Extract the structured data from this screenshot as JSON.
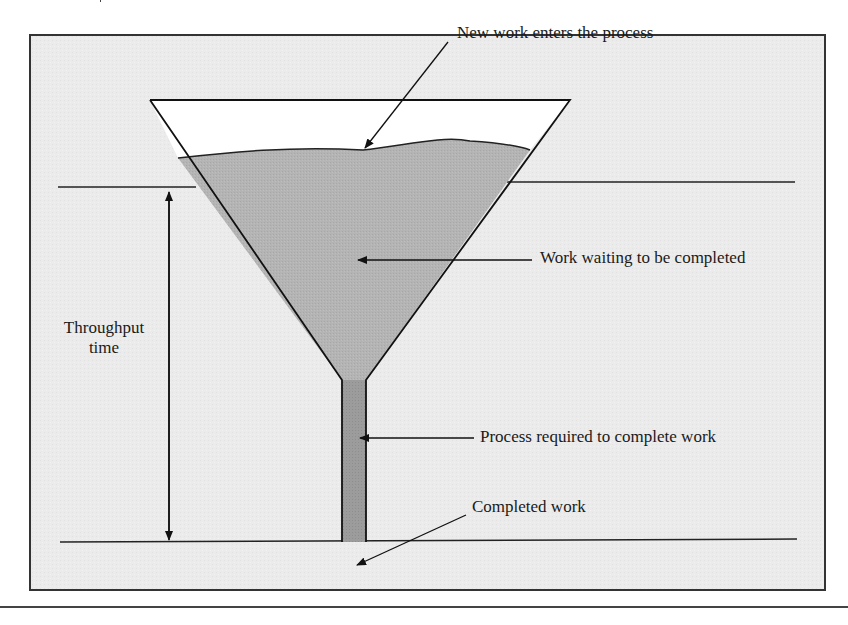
{
  "diagram": {
    "type": "funnel-process-diagram",
    "colors": {
      "frame_background": "#ececec",
      "frame_border": "#333333",
      "funnel_empty": "#ffffff",
      "work_waiting_fill": "#b3b3b3",
      "process_tube_fill": "#9a9a9a",
      "line_color": "#222222"
    },
    "labels": {
      "new_work": "New work enters the process",
      "work_waiting": "Work waiting to be completed",
      "throughput_line1": "Throughput",
      "throughput_line2": "time",
      "process_required": "Process required to complete work",
      "completed_work": "Completed work"
    }
  }
}
